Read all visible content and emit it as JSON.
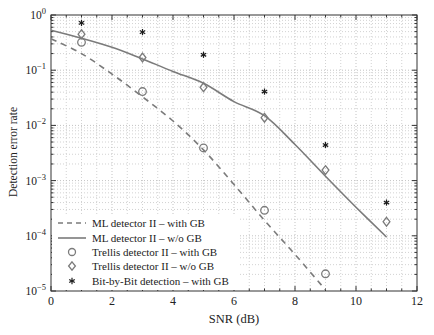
{
  "figure": {
    "background": "#ffffff"
  },
  "chart_data": {
    "type": "line",
    "title": "",
    "xlabel": "SNR (dB)",
    "ylabel": "Detection error rate",
    "yscale": "log",
    "xlim": [
      0,
      12
    ],
    "ylim": [
      1e-05,
      1
    ],
    "xticks": [
      0,
      2,
      4,
      6,
      8,
      10,
      12
    ],
    "x_minor_step": 0.5,
    "yticks_exponents": [
      0,
      -1,
      -2,
      -3,
      -4,
      -5
    ],
    "grid": "dotted, major and minor, both axes",
    "legend_position": "inside bottom-left",
    "colors": {
      "axis": "#333333",
      "grid_major": "#c3c3c3",
      "grid_minor": "#d2d2d2",
      "text": "#222222",
      "line_gray": "#7b7b7b",
      "marker_black": "#1c1c1c"
    },
    "series": [
      {
        "id": "ml-detector-ii-with-gb",
        "label": "ML detector II – with GB",
        "type": "line",
        "style": "dashed",
        "color": "#7b7b7b",
        "x": [
          0,
          1,
          2,
          3,
          4,
          5,
          6,
          7,
          8,
          9
        ],
        "y": [
          0.37,
          0.2,
          0.085,
          0.033,
          0.012,
          0.0036,
          0.00085,
          0.00019,
          4.6e-05,
          1.05e-05
        ]
      },
      {
        "id": "ml-detector-ii-wo-gb",
        "label": "ML detector II – w/o GB",
        "type": "line",
        "style": "solid",
        "color": "#7b7b7b",
        "x": [
          0,
          1,
          2,
          3,
          4,
          5,
          6,
          7,
          8,
          9,
          10,
          11
        ],
        "y": [
          0.53,
          0.38,
          0.26,
          0.16,
          0.095,
          0.058,
          0.027,
          0.015,
          0.0045,
          0.0012,
          0.00033,
          9.5e-05
        ]
      },
      {
        "id": "trellis-detector-ii-with-gb",
        "label": "Trellis detector II – with GB",
        "type": "scatter",
        "marker": "circle",
        "color": "#7b7b7b",
        "x": [
          1,
          3,
          5,
          7,
          9
        ],
        "y": [
          0.32,
          0.041,
          0.0039,
          0.00029,
          2.05e-05
        ]
      },
      {
        "id": "trellis-detector-ii-wo-gb",
        "label": "Trellis detector II – w/o GB",
        "type": "scatter",
        "marker": "diamond",
        "color": "#7b7b7b",
        "x": [
          1,
          3,
          5,
          7,
          9,
          11
        ],
        "y": [
          0.45,
          0.17,
          0.049,
          0.0138,
          0.00155,
          0.00018
        ]
      },
      {
        "id": "bit-by-bit-detection-with-gb",
        "label": "Bit-by-Bit detection – with GB",
        "type": "scatter",
        "marker": "asterisk",
        "color": "#1c1c1c",
        "x": [
          1,
          3,
          5,
          7,
          9,
          11
        ],
        "y": [
          0.72,
          0.49,
          0.19,
          0.041,
          0.0044,
          0.0004
        ]
      }
    ]
  }
}
